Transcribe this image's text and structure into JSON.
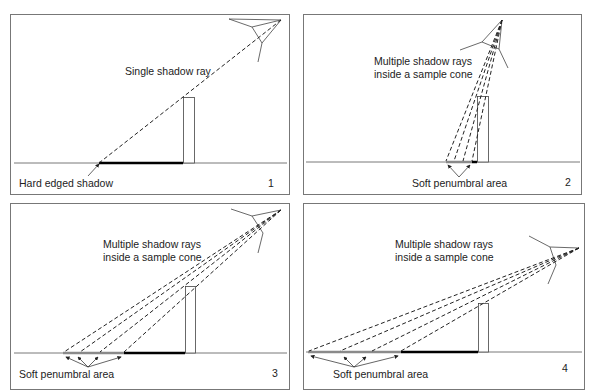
{
  "figure": {
    "panels": [
      {
        "id": 1,
        "number": "1",
        "caption_top": [
          "Single shadow ray"
        ],
        "caption_bottom": "Hard edged shadow",
        "rays": 1,
        "description": "Single shadow ray produces a hard edged shadow"
      },
      {
        "id": 2,
        "number": "2",
        "caption_top": [
          "Multiple shadow rays",
          "inside a sample cone"
        ],
        "caption_bottom": "Soft penumbral area",
        "rays": 4,
        "description": "Light high above, narrow penumbra"
      },
      {
        "id": 3,
        "number": "3",
        "caption_top": [
          "Multiple shadow rays",
          "inside a sample cone"
        ],
        "caption_bottom": "Soft penumbral area",
        "rays": 4,
        "description": "Light lower, wider penumbra"
      },
      {
        "id": 4,
        "number": "4",
        "caption_top": [
          "Multiple shadow rays",
          "inside a sample cone"
        ],
        "caption_bottom": "Soft penumbral area",
        "rays": 4,
        "description": "Light very low, widest penumbra"
      }
    ],
    "colors": {
      "border": "#777777",
      "line": "#333333",
      "shadow_hard": "#000000",
      "shadow_soft": "#8a8a8a",
      "ray": "#222222"
    }
  }
}
